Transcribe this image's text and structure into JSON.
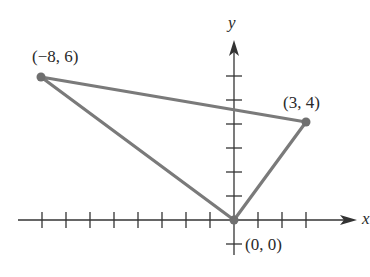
{
  "diagram": {
    "type": "triangle-on-coordinate-plane",
    "axes": {
      "x_label": "x",
      "y_label": "y",
      "x_ticks": [
        -8,
        -7,
        -6,
        -5,
        -4,
        -3,
        -2,
        -1,
        1,
        2,
        3
      ],
      "y_ticks": [
        -1,
        1,
        2,
        3,
        4,
        5,
        6
      ],
      "axis_color": "#333333"
    },
    "vertices": [
      {
        "label": "(−8, 6)",
        "x": -8,
        "y": 6
      },
      {
        "label": "(3, 4)",
        "x": 3,
        "y": 4
      },
      {
        "label": "(0, 0)",
        "x": 0,
        "y": 0
      }
    ],
    "edge_color": "#7a7a7a",
    "point_color": "#6f6f6f"
  }
}
